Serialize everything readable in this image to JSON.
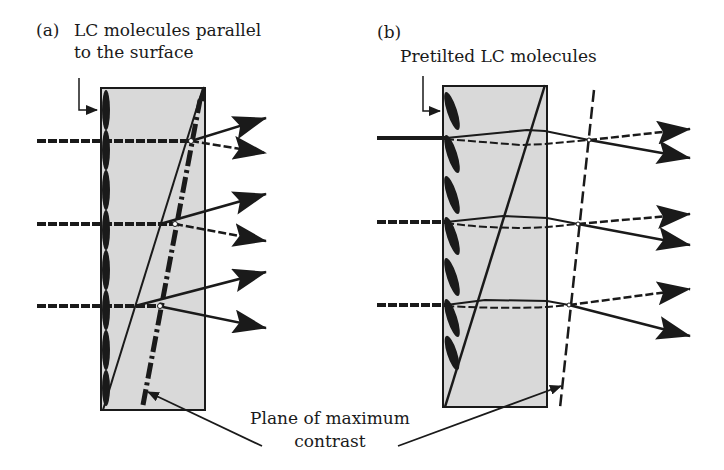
{
  "figure": {
    "panels": [
      {
        "id": "a",
        "tag": "(a)",
        "label_line1": "LC molecules parallel",
        "label_line2": "to the surface",
        "molecule_orientation": "parallel",
        "plane_style": "dash-dot"
      },
      {
        "id": "b",
        "tag": "(b)",
        "label_line1": "Pretilted LC molecules",
        "molecule_orientation": "pretilted",
        "plane_style": "dashed"
      }
    ],
    "shared_label": {
      "line1": "Plane of maximum",
      "line2": "contrast"
    },
    "colors": {
      "cell_fill": "#d9d9d9",
      "stroke": "#1a1a1a",
      "background": "#ffffff"
    }
  }
}
